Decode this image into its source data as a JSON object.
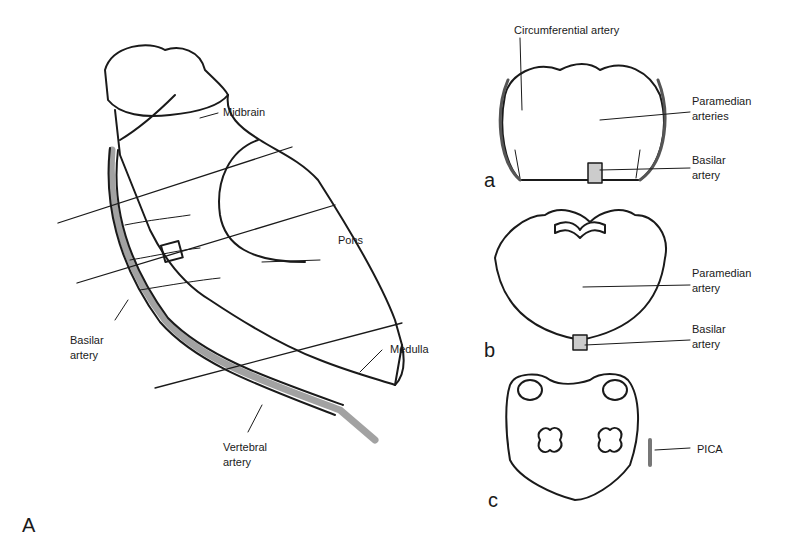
{
  "figure": {
    "panel_A": {
      "letter": "A",
      "labels": {
        "midbrain": "Midbrain",
        "pons": "Pons",
        "basilar_line1": "Basilar",
        "basilar_line2": "artery",
        "medulla": "Medulla",
        "vertebral_line1": "Vertebral",
        "vertebral_line2": "artery"
      }
    },
    "panel_a": {
      "letter": "a",
      "labels": {
        "circumferential": "Circumferential artery",
        "paramedian_line1": "Paramedian",
        "paramedian_line2": "arteries",
        "basilar_line1": "Basilar",
        "basilar_line2": "artery"
      }
    },
    "panel_b": {
      "letter": "b",
      "labels": {
        "paramedian_line1": "Paramedian",
        "paramedian_line2": "artery",
        "basilar_line1": "Basilar",
        "basilar_line2": "artery"
      }
    },
    "panel_c": {
      "letter": "c",
      "labels": {
        "pica": "PICA"
      }
    }
  }
}
